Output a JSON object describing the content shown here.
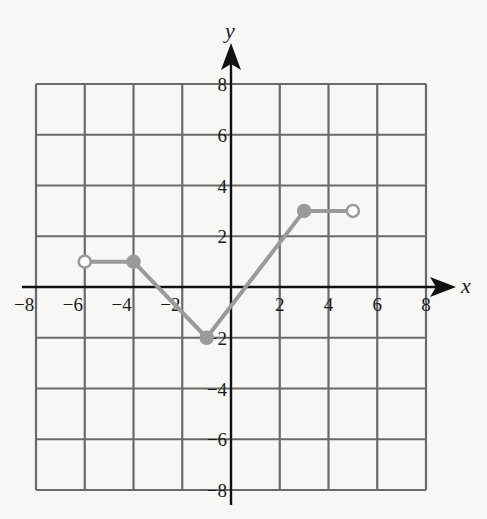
{
  "caption": "",
  "chart_data": {
    "type": "line",
    "title": "",
    "xlabel": "x",
    "ylabel": "y",
    "xlim": [
      -8,
      8
    ],
    "ylim": [
      -8,
      8
    ],
    "grid": true,
    "grid_step": 2,
    "x_ticks": [
      "−8",
      "−6",
      "−4",
      "−2",
      "2",
      "4",
      "6",
      "8"
    ],
    "y_ticks": [
      "8",
      "6",
      "4",
      "2",
      "−2",
      "−4",
      "−6",
      "−8"
    ],
    "series": [
      {
        "name": "f(x)",
        "color": "#9a9a9a",
        "points": [
          {
            "x": -6,
            "y": 1,
            "endpoint": "open"
          },
          {
            "x": -4,
            "y": 1,
            "endpoint": "closed"
          },
          {
            "x": -1,
            "y": -2,
            "endpoint": "closed"
          },
          {
            "x": 3,
            "y": 3,
            "endpoint": "closed"
          },
          {
            "x": 5,
            "y": 3,
            "endpoint": "open"
          }
        ]
      }
    ]
  },
  "colors": {
    "background": "#f7f7f5",
    "grid": "#6a6a6a",
    "axis": "#111111",
    "curve": "#9a9a9a"
  }
}
